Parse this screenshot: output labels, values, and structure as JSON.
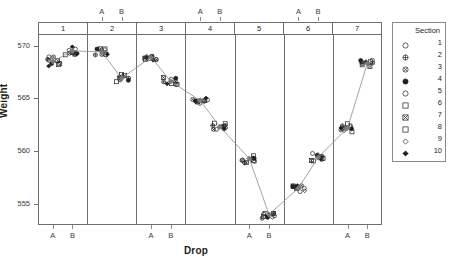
{
  "chart_data": {
    "type": "scatter",
    "title": "",
    "xlabel": "Drop",
    "ylabel": "Weight",
    "ylim": [
      553,
      571
    ],
    "yticks": [
      555,
      560,
      565,
      570
    ],
    "grid": false,
    "legend_position": "right",
    "panel_label": "Section",
    "panels": [
      "1",
      "2",
      "3",
      "4",
      "5",
      "6",
      "7"
    ],
    "x_levels": [
      "A",
      "B"
    ],
    "x_axis_bottom_panels": [
      "1",
      "3",
      "5",
      "7"
    ],
    "x_axis_top_panels": [
      "2",
      "4",
      "6"
    ],
    "series": [
      {
        "name": "mean-trend",
        "values": [
          569.3,
          568.9,
          568.2,
          566.9,
          569.2,
          567.9,
          566.1,
          564.3,
          562.5,
          561.0,
          559.2,
          556.6,
          554.1,
          553.6,
          556.5,
          559.2,
          560.9,
          562.4,
          562.2,
          565.0,
          568.3
        ],
        "note": "connected mean markers across 7 panels, A and B levels"
      }
    ],
    "panel_clusters": [
      {
        "panel": "1",
        "level": "A",
        "center": 568.5,
        "n": 10,
        "spread": 0.55
      },
      {
        "panel": "1",
        "level": "B",
        "center": 569.5,
        "n": 10,
        "spread": 0.45
      },
      {
        "panel": "2",
        "level": "A",
        "center": 569.4,
        "n": 10,
        "spread": 0.4
      },
      {
        "panel": "2",
        "level": "B",
        "center": 566.9,
        "n": 10,
        "spread": 0.45
      },
      {
        "panel": "3",
        "level": "A",
        "center": 568.9,
        "n": 10,
        "spread": 0.4
      },
      {
        "panel": "3",
        "level": "B",
        "center": 566.6,
        "n": 10,
        "spread": 0.45
      },
      {
        "panel": "4",
        "level": "A",
        "center": 564.8,
        "n": 10,
        "spread": 0.4
      },
      {
        "panel": "4",
        "level": "B",
        "center": 562.3,
        "n": 10,
        "spread": 0.45
      },
      {
        "panel": "5",
        "level": "A",
        "center": 559.3,
        "n": 10,
        "spread": 0.5
      },
      {
        "panel": "5",
        "level": "B",
        "center": 554.0,
        "n": 10,
        "spread": 0.45
      },
      {
        "panel": "6",
        "level": "A",
        "center": 556.5,
        "n": 10,
        "spread": 0.45
      },
      {
        "panel": "6",
        "level": "B",
        "center": 559.4,
        "n": 10,
        "spread": 0.5
      },
      {
        "panel": "7",
        "level": "A",
        "center": 562.2,
        "n": 10,
        "spread": 0.5
      },
      {
        "panel": "7",
        "level": "B",
        "center": 568.3,
        "n": 10,
        "spread": 0.45
      }
    ],
    "colors": {
      "marker": "#231f20",
      "line": "#8c8c8c",
      "frame": "#6e6e6e",
      "text": "#231f20"
    }
  },
  "legend": {
    "title": "Section",
    "items": [
      {
        "value": "1",
        "symbol": "circle-open"
      },
      {
        "value": "2",
        "symbol": "circle-plus"
      },
      {
        "value": "3",
        "symbol": "circle-x"
      },
      {
        "value": "4",
        "symbol": "circle-dot"
      },
      {
        "value": "5",
        "symbol": "circle-open"
      },
      {
        "value": "6",
        "symbol": "square-open"
      },
      {
        "value": "7",
        "symbol": "square-x"
      },
      {
        "value": "8",
        "symbol": "square-open"
      },
      {
        "value": "9",
        "symbol": "diamond-open"
      },
      {
        "value": "10",
        "symbol": "diamond-filled"
      }
    ]
  },
  "axes": {
    "y_title": "Weight",
    "y_ticks": [
      "570",
      "565",
      "560",
      "555"
    ],
    "x_title": "Drop",
    "x_tick_labels": [
      "A",
      "B"
    ]
  }
}
